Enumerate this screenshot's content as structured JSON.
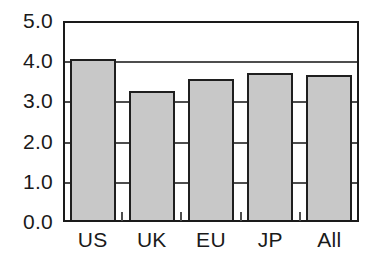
{
  "chart_data": {
    "type": "bar",
    "title": "",
    "subtitle": "",
    "xlabel": "",
    "ylabel": "",
    "categories": [
      "US",
      "UK",
      "EU",
      "JP",
      "All"
    ],
    "values": [
      4.0,
      3.2,
      3.5,
      3.65,
      3.6
    ],
    "series": [
      {
        "name": "",
        "values": [
          4.0,
          3.2,
          3.5,
          3.65,
          3.6
        ]
      }
    ],
    "ylim": [
      0.0,
      5.0
    ],
    "ytick_labels": [
      "0.0",
      "1.0",
      "2.0",
      "3.0",
      "4.0",
      "5.0"
    ],
    "ytick_values": [
      0.0,
      1.0,
      2.0,
      3.0,
      4.0,
      5.0
    ],
    "grid": true,
    "grid_axis": "y",
    "legend": false,
    "legend_position": "none",
    "annotations": [],
    "colors": {
      "bar_fill": "#c8c8c8",
      "bar_edge": "#1f1f1f",
      "gridline": "#4d4d4d",
      "frame": "#1a1a1a",
      "background": "#ffffff",
      "text": "#1a1a1a"
    }
  }
}
